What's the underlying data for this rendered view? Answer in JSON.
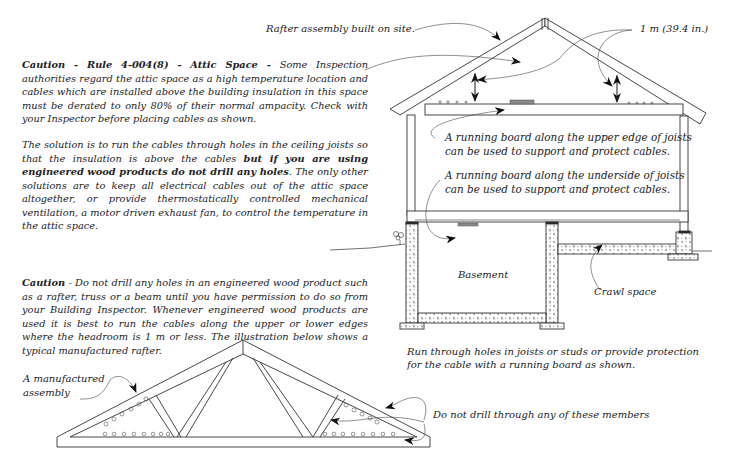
{
  "top_diagram": {
    "label_rafter_assembly": "Rafter assembly built on site.",
    "label_headroom": "1 m (39.4 in.)",
    "label_upper_board_line1": "A running board along the upper edge of joists",
    "label_upper_board_line2": "can be used to support and protect cables.",
    "label_under_board_line1": "A running board along the underside of joists",
    "label_under_board_line2": "can be used to support and protect cables.",
    "label_basement": "Basement",
    "label_crawl_space": "Crawl space",
    "caption_line1": "Run through holes in joists or studs or provide protection",
    "caption_line2": "for the cable with a running board as shown."
  },
  "caution_attic": {
    "heading": "Caution - Rule 4-004(8) - Attic Space - ",
    "body": "Some Inspection authorities regard the attic space as a high temperature location and cables which are installed above the building insulation in this space must be derated to only 80% of their normal ampacity.  Check with your Inspector before placing cables as shown."
  },
  "solution": {
    "intro": "The solution is to run the cables through holes in the ceiling joists  so that the insulation is above the cables ",
    "bold": "but if you are using engineered wood products do not drill any holes",
    "rest": ".  The only other solutions are to keep all electrical cables out of the attic space altogether, or provide thermostatically controlled mechanical ventilation, a motor driven exhaust fan, to control the temperature in the attic space."
  },
  "caution_engineered": {
    "heading": "Caution",
    "body": " - Do not drill any holes in an engineered wood product such as a rafter, truss or a beam until you have permission to do so from your Building Inspector.  Whenever engineered wood products are used it is best to run the cables along the upper or lower edges where the headroom is 1 m or less. The illustration below shows a typical manufactured rafter."
  },
  "truss_diagram": {
    "label_assembly_line1": "A manufactured",
    "label_assembly_line2": "assembly",
    "label_members": "Do not drill through any of these members"
  },
  "colors": {
    "ink": "#222222",
    "background": "#ffffff"
  }
}
